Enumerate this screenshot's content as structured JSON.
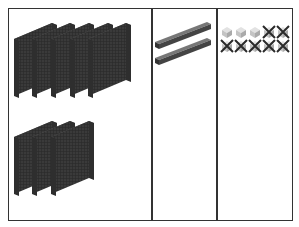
{
  "diagram": {
    "type": "place-value-blocks",
    "columns": [
      {
        "name": "hundreds",
        "count": 8,
        "description": "flat blocks (hundreds)"
      },
      {
        "name": "tens",
        "count": 2,
        "description": "rods (tens)"
      },
      {
        "name": "ones",
        "count": 3,
        "crossed_out": 7,
        "total_shown": 10,
        "description": "unit cubes (ones), 7 crossed out"
      }
    ],
    "colors": {
      "block": "#3a3a3a",
      "block_top": "#5a5a5a",
      "unit": "#c8c8c8",
      "cross": "#2a2a2a",
      "border": "#333333"
    }
  }
}
